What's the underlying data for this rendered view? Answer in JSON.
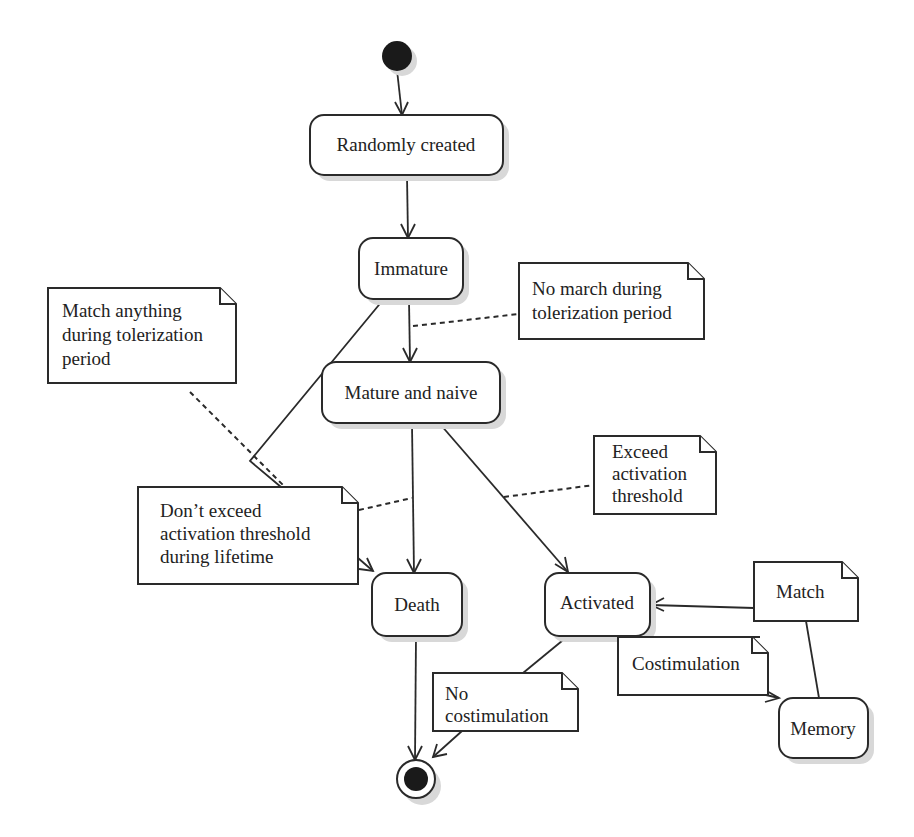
{
  "diagram": {
    "type": "uml-state-diagram",
    "initial_node": {
      "label": ""
    },
    "final_node": {
      "label": ""
    },
    "states": {
      "randomly_created": "Randomly created",
      "immature": "Immature",
      "mature_and_naive": "Mature and naive",
      "death": "Death",
      "activated": "Activated",
      "memory": "Memory"
    },
    "notes": {
      "match_anything": [
        "Match anything",
        "during tolerization",
        "period"
      ],
      "no_march": [
        "No march during",
        "tolerization period"
      ],
      "exceed": [
        "Exceed",
        "activation",
        "threshold"
      ],
      "dont_exceed": [
        "Don’t exceed",
        "activation threshold",
        "during lifetime"
      ],
      "match": [
        "Match"
      ],
      "costimulation": [
        "Costimulation"
      ],
      "no_costimulation": [
        "No",
        "costimulation"
      ]
    },
    "transitions": [
      {
        "from": "initial",
        "to": "Randomly created"
      },
      {
        "from": "Randomly created",
        "to": "Immature"
      },
      {
        "from": "Immature",
        "to": "Mature and naive",
        "note": "No march during tolerization period"
      },
      {
        "from": "Immature",
        "to": "Death",
        "note": "Match anything during tolerization period"
      },
      {
        "from": "Mature and naive",
        "to": "Death",
        "note": "Don’t exceed activation threshold during lifetime"
      },
      {
        "from": "Mature and naive",
        "to": "Activated",
        "note": "Exceed activation threshold"
      },
      {
        "from": "Memory",
        "to": "Activated",
        "note": "Match"
      },
      {
        "from": "Activated",
        "to": "Memory",
        "note": "Costimulation"
      },
      {
        "from": "Activated",
        "to": "final",
        "note": "No costimulation"
      },
      {
        "from": "Death",
        "to": "final"
      }
    ]
  }
}
